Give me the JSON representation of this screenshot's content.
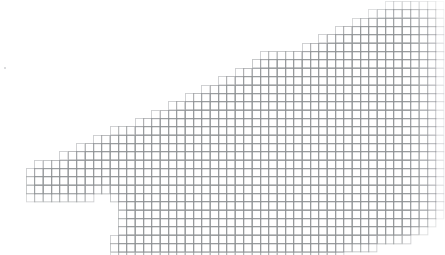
{
  "meta": {
    "title": "Grid Mosaic Silhouette",
    "width": 445,
    "height": 255
  },
  "canvas": {
    "background_color": "#ffffff",
    "label": "mosaic-canvas"
  },
  "grid": {
    "cell_size": 8.35,
    "origin_x": 1.0,
    "origin_y": 1.0,
    "line_color": "#8f9295",
    "line_width": 0.9,
    "fill_color": "#ffffff",
    "columns": 53,
    "rows": 31,
    "edge_fade": true,
    "fade_strength": 0.62
  },
  "chart_data": {
    "type": "heatmap",
    "title": "Grid mosaic silhouette",
    "xlabel": "",
    "ylabel": "",
    "legend": "none",
    "grid": true,
    "cell_states": [
      "empty",
      "filled"
    ],
    "x": [
      0,
      1,
      2,
      3,
      4,
      5,
      6,
      7,
      8,
      9,
      10,
      11,
      12,
      13,
      14,
      15,
      16,
      17,
      18,
      19,
      20,
      21,
      22,
      23,
      24,
      25,
      26,
      27,
      28,
      29,
      30,
      31,
      32,
      33,
      34,
      35,
      36,
      37,
      38,
      39,
      40,
      41,
      42,
      43,
      44,
      45,
      46,
      47,
      48,
      49,
      50,
      51,
      52
    ],
    "y": [
      0,
      1,
      2,
      3,
      4,
      5,
      6,
      7,
      8,
      9,
      10,
      11,
      12,
      13,
      14,
      15,
      16,
      17,
      18,
      19,
      20,
      21,
      22,
      23,
      24,
      25,
      26,
      27,
      28,
      29,
      30
    ],
    "row_spans": [
      {
        "row": 0,
        "spans": [
          [
            46,
            52
          ]
        ]
      },
      {
        "row": 1,
        "spans": [
          [
            44,
            52
          ]
        ]
      },
      {
        "row": 2,
        "spans": [
          [
            42,
            52
          ]
        ]
      },
      {
        "row": 3,
        "spans": [
          [
            40,
            52
          ]
        ]
      },
      {
        "row": 4,
        "spans": [
          [
            38,
            52
          ]
        ]
      },
      {
        "row": 5,
        "spans": [
          [
            36,
            52
          ]
        ]
      },
      {
        "row": 6,
        "spans": [
          [
            31,
            52
          ]
        ]
      },
      {
        "row": 7,
        "spans": [
          [
            30,
            52
          ]
        ]
      },
      {
        "row": 8,
        "spans": [
          [
            28,
            52
          ]
        ]
      },
      {
        "row": 9,
        "spans": [
          [
            26,
            52
          ]
        ]
      },
      {
        "row": 10,
        "spans": [
          [
            24,
            52
          ]
        ]
      },
      {
        "row": 11,
        "spans": [
          [
            22,
            52
          ]
        ]
      },
      {
        "row": 12,
        "spans": [
          [
            20,
            52
          ]
        ]
      },
      {
        "row": 13,
        "spans": [
          [
            18,
            52
          ]
        ]
      },
      {
        "row": 14,
        "spans": [
          [
            16,
            52
          ]
        ]
      },
      {
        "row": 15,
        "spans": [
          [
            13,
            52
          ]
        ]
      },
      {
        "row": 16,
        "spans": [
          [
            11,
            52
          ]
        ]
      },
      {
        "row": 17,
        "spans": [
          [
            9,
            52
          ]
        ]
      },
      {
        "row": 18,
        "spans": [
          [
            7,
            52
          ]
        ]
      },
      {
        "row": 19,
        "spans": [
          [
            4,
            52
          ]
        ]
      },
      {
        "row": 20,
        "spans": [
          [
            3,
            52
          ]
        ]
      },
      {
        "row": 21,
        "spans": [
          [
            3,
            52
          ]
        ]
      },
      {
        "row": 22,
        "spans": [
          [
            3,
            52
          ]
        ]
      },
      {
        "row": 23,
        "spans": [
          [
            3,
            10
          ],
          [
            13,
            52
          ]
        ]
      },
      {
        "row": 24,
        "spans": [
          [
            14,
            52
          ]
        ]
      },
      {
        "row": 25,
        "spans": [
          [
            14,
            52
          ]
        ]
      },
      {
        "row": 26,
        "spans": [
          [
            14,
            51
          ]
        ]
      },
      {
        "row": 27,
        "spans": [
          [
            14,
            50
          ]
        ]
      },
      {
        "row": 28,
        "spans": [
          [
            13,
            48
          ]
        ]
      },
      {
        "row": 29,
        "spans": [
          [
            13,
            44
          ]
        ]
      },
      {
        "row": 30,
        "spans": [
          [
            13,
            40
          ]
        ]
      }
    ]
  },
  "shape": {
    "name": "grid-silhouette",
    "notes": "Second mask layer describing the lower body, the concave notch and the two legs below the main mass.",
    "lower_rows": [
      {
        "row": 17,
        "spans": [
          [
            15,
            42
          ]
        ]
      },
      {
        "row": 18,
        "spans": [
          [
            15,
            40
          ]
        ]
      },
      {
        "row": 19,
        "spans": [
          [
            14,
            38
          ]
        ]
      },
      {
        "row": 20,
        "spans": [
          [
            14,
            36
          ]
        ]
      },
      {
        "row": 21,
        "spans": [
          [
            13,
            34
          ]
        ]
      },
      {
        "row": 22,
        "spans": [
          [
            13,
            30
          ]
        ]
      },
      {
        "row": 23,
        "spans": [
          [
            13,
            26
          ]
        ]
      },
      {
        "row": 24,
        "spans": [
          [
            14,
            24
          ]
        ]
      },
      {
        "row": 25,
        "spans": [
          [
            14,
            20
          ]
        ]
      },
      {
        "row": 26,
        "spans": [
          [
            14,
            19
          ]
        ]
      },
      {
        "row": 27,
        "spans": [
          [
            14,
            19
          ],
          [
            21,
            25
          ]
        ]
      },
      {
        "row": 28,
        "spans": [
          [
            14,
            19
          ],
          [
            21,
            25
          ]
        ]
      },
      {
        "row": 29,
        "spans": [
          [
            14,
            19
          ],
          [
            21,
            25
          ]
        ]
      },
      {
        "row": 30,
        "spans": [
          [
            14,
            19
          ],
          [
            21,
            25
          ]
        ]
      }
    ]
  }
}
